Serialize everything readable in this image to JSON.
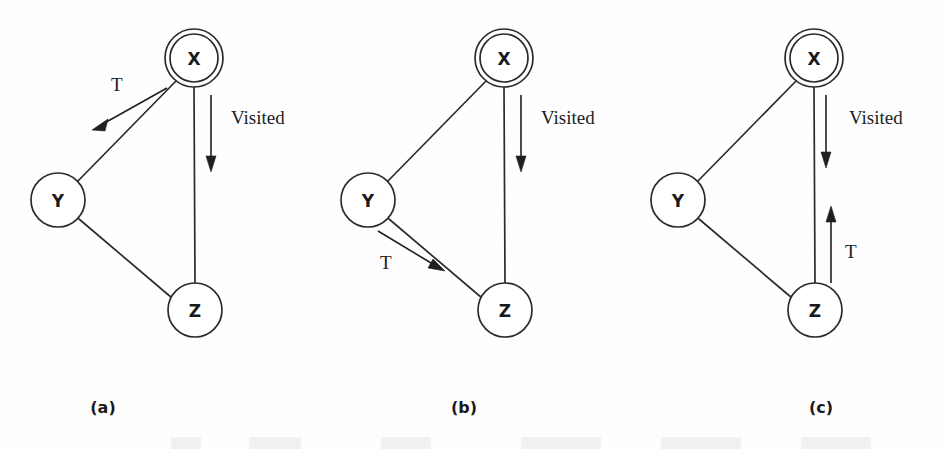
{
  "figure": {
    "background_color": "#fefefe",
    "ink_color": "#2b2b2b",
    "panels": [
      {
        "id": "a",
        "caption": "(a)",
        "nodes": [
          {
            "id": "x",
            "label": "X",
            "cx": 194,
            "cy": 58,
            "r": 24,
            "double_ring": true,
            "ring_r": 29
          },
          {
            "id": "y",
            "label": "Y",
            "cx": 58,
            "cy": 200,
            "r": 27,
            "double_ring": false,
            "ring_r": 27
          },
          {
            "id": "z",
            "label": "Z",
            "cx": 195,
            "cy": 310,
            "r": 27,
            "double_ring": false,
            "ring_r": 27
          }
        ],
        "edges": [
          {
            "from": "x",
            "to": "y"
          },
          {
            "from": "x",
            "to": "z"
          },
          {
            "from": "y",
            "to": "z"
          }
        ],
        "arrows": [
          {
            "label": "T",
            "label_x": 117,
            "label_y": 87,
            "x1": 167,
            "y1": 88,
            "x2": 97,
            "y2": 128,
            "direction": "down-left",
            "along_edge": "x-y"
          },
          {
            "label": "Visited",
            "label_x": 231,
            "label_y": 120,
            "x1": 210,
            "y1": 95,
            "x2": 210,
            "y2": 170,
            "direction": "down",
            "along_edge": "x-z"
          }
        ]
      },
      {
        "id": "b",
        "caption": "(b)",
        "nodes": [
          {
            "id": "x",
            "label": "X",
            "cx": 194,
            "cy": 58,
            "r": 24,
            "double_ring": true,
            "ring_r": 29
          },
          {
            "id": "y",
            "label": "Y",
            "cx": 58,
            "cy": 200,
            "r": 27,
            "double_ring": false,
            "ring_r": 27
          },
          {
            "id": "z",
            "label": "Z",
            "cx": 195,
            "cy": 310,
            "r": 27,
            "double_ring": false,
            "ring_r": 27
          }
        ],
        "edges": [
          {
            "from": "x",
            "to": "y"
          },
          {
            "from": "x",
            "to": "z"
          },
          {
            "from": "y",
            "to": "z"
          }
        ],
        "arrows": [
          {
            "label": "T",
            "label_x": 75,
            "label_y": 265,
            "x1": 78,
            "y1": 228,
            "x2": 133,
            "y2": 270,
            "direction": "down-right",
            "along_edge": "y-z"
          },
          {
            "label": "Visited",
            "label_x": 231,
            "label_y": 120,
            "x1": 210,
            "y1": 95,
            "x2": 210,
            "y2": 170,
            "direction": "down",
            "along_edge": "x-z"
          }
        ]
      },
      {
        "id": "c",
        "caption": "(c)",
        "nodes": [
          {
            "id": "x",
            "label": "X",
            "cx": 194,
            "cy": 58,
            "r": 24,
            "double_ring": true,
            "ring_r": 29
          },
          {
            "id": "y",
            "label": "Y",
            "cx": 58,
            "cy": 200,
            "r": 27,
            "double_ring": false,
            "ring_r": 27
          },
          {
            "id": "z",
            "label": "Z",
            "cx": 195,
            "cy": 310,
            "r": 27,
            "double_ring": false,
            "ring_r": 27
          }
        ],
        "edges": [
          {
            "from": "x",
            "to": "y"
          },
          {
            "from": "x",
            "to": "z"
          },
          {
            "from": "y",
            "to": "z"
          }
        ],
        "arrows": [
          {
            "label": "Visited",
            "label_x": 229,
            "label_y": 120,
            "x1": 206,
            "y1": 95,
            "x2": 206,
            "y2": 167,
            "direction": "down",
            "along_edge": "x-z"
          },
          {
            "label": "T",
            "label_x": 227,
            "label_y": 254,
            "x1": 211,
            "y1": 283,
            "x2": 211,
            "y2": 208,
            "direction": "up",
            "along_edge": "z-x"
          }
        ]
      }
    ]
  }
}
